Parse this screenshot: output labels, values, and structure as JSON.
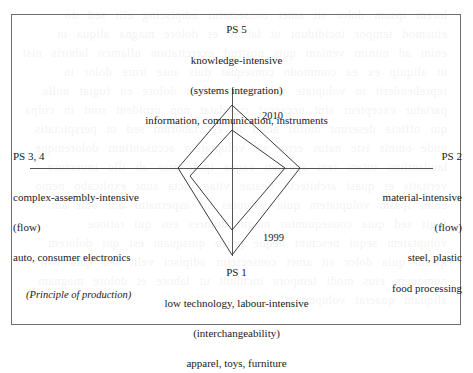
{
  "figure": {
    "top_label": {
      "code": "PS 5",
      "line1": "knowledge-intensive",
      "line2": "(systems integration)",
      "line3": "information, communication, instruments"
    },
    "left_label": {
      "code": "PS 3, 4",
      "line1": "complex-assembly-intensive",
      "line2": "(flow)",
      "line3": "auto, consumer electronics"
    },
    "right_label": {
      "code": "PS 2",
      "line1": "material-intensive",
      "line2": "(flow)",
      "line3": "steel, plastic",
      "line4": "food processing"
    },
    "bottom_label": {
      "code": "PS 1",
      "line1": "low technology, labour-intensive",
      "line2": "(interchangeability)",
      "line3": "apparel, toys, furniture"
    },
    "caption_note": "(Principle of production)",
    "series_labels": {
      "outer": "2010",
      "inner": "1999"
    },
    "colors": {
      "frame": "#6e6e6e",
      "axis": "#555555",
      "series_line": "#3a3a3a",
      "text": "#1a1a1a"
    }
  },
  "chart_data": {
    "type": "line",
    "subtype": "radar",
    "title": "",
    "grid": false,
    "legend_position": "inline-annotations",
    "axes": [
      {
        "key": "top",
        "angle_deg": 90,
        "label": "PS 5",
        "label_full": "knowledge-intensive (systems integration) — information, communication, instruments"
      },
      {
        "key": "right",
        "angle_deg": 0,
        "label": "PS 2",
        "label_full": "material-intensive (flow) — steel, plastic, food processing"
      },
      {
        "key": "bottom",
        "angle_deg": 270,
        "label": "PS 1",
        "label_full": "low technology, labour-intensive (interchangeability) — apparel, toys, furniture"
      },
      {
        "key": "left",
        "angle_deg": 180,
        "label": "PS 3, 4",
        "label_full": "complex-assembly-intensive (flow) — auto, consumer electronics"
      }
    ],
    "categories": [
      "PS 5",
      "PS 2",
      "PS 1",
      "PS 3, 4"
    ],
    "series": [
      {
        "name": "2010",
        "values": [
          63,
          68,
          87,
          54
        ]
      },
      {
        "name": "1999",
        "values": [
          38,
          53,
          62,
          42
        ]
      }
    ],
    "center_px": {
      "x": 232,
      "y": 168
    },
    "geometry_px": {
      "axis_horizontal": {
        "x1": 30,
        "x2": 433,
        "y": 168
      },
      "axis_vertical": {
        "y1": 88,
        "y2": 256,
        "x": 232
      },
      "series": [
        {
          "name": "2010",
          "points": [
            [
              232,
              105
            ],
            [
              300,
              168
            ],
            [
              232,
              255
            ],
            [
              178,
              168
            ]
          ]
        },
        {
          "name": "1999",
          "points": [
            [
              232,
              130
            ],
            [
              285,
              168
            ],
            [
              232,
              230
            ],
            [
              190,
              176
            ]
          ]
        }
      ]
    },
    "ylabel": "",
    "xlabel": ""
  },
  "bleed_text": "a page of printed body text faintly showing through from the reverse side of the sheet, illegible"
}
